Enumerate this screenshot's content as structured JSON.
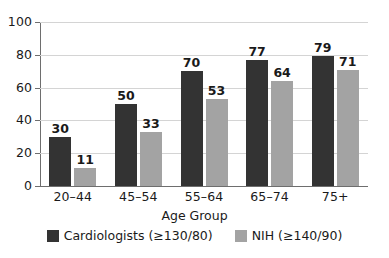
{
  "chart_data": {
    "type": "bar",
    "title": "",
    "xlabel": "Age Group",
    "ylabel": "",
    "categories": [
      "20–44",
      "45–54",
      "55–64",
      "65–74",
      "75+"
    ],
    "series": [
      {
        "name": "Cardiologists (≥130/80)",
        "color": "#333333",
        "values": [
          30,
          50,
          70,
          77,
          79
        ]
      },
      {
        "name": "NIH (≥140/90)",
        "color": "#a3a3a3",
        "values": [
          11,
          33,
          53,
          64,
          71
        ]
      }
    ],
    "ylim": [
      0,
      100
    ],
    "yticks": [
      0,
      20,
      40,
      60,
      80,
      100
    ],
    "ytick_labels": [
      "0",
      "20",
      "40",
      "60",
      "80",
      "100"
    ],
    "grid": true,
    "legend_position": "bottom",
    "data_labels": true
  },
  "legend": {
    "items": [
      {
        "label": "Cardiologists (≥130/80)",
        "color": "#333333"
      },
      {
        "label": "NIH (≥140/90)",
        "color": "#a3a3a3"
      }
    ]
  },
  "colors": {
    "series_dark": "#333333",
    "series_light": "#a3a3a3",
    "grid": "#d4d4d4",
    "axis": "#6e6e6e",
    "text": "#1a1a1a",
    "background": "#ffffff"
  }
}
